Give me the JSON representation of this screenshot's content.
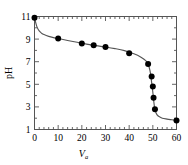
{
  "figure": {
    "background_color": "#ffffff",
    "line_color": "#555555",
    "marker_color": "#000000",
    "axis_color": "#555555"
  },
  "chart_data": {
    "type": "line",
    "title": "",
    "subtitle": "",
    "xlabel": "V",
    "xlabel_subscript": "a",
    "ylabel": "pH",
    "xlim": [
      0,
      60
    ],
    "ylim": [
      1,
      11
    ],
    "grid": false,
    "legend": null,
    "x_major_ticks": [
      0,
      10,
      20,
      30,
      40,
      50,
      60
    ],
    "x_tick_labels": [
      "0",
      "10",
      "20",
      "30",
      "40",
      "50",
      "60"
    ],
    "x_minor_interval": 2,
    "y_major_ticks": [
      1,
      3,
      5,
      7,
      9,
      11
    ],
    "y_tick_labels": [
      "1",
      "3",
      "5",
      "7",
      "9",
      "11"
    ],
    "y_minor_interval": 1,
    "ticks_direction": "in",
    "ticks_all_sides": true,
    "series": [
      {
        "name": "titration curve",
        "marker": "filled-circle",
        "x": [
          0,
          10,
          20,
          25,
          30,
          40,
          48,
          49.5,
          50,
          50.3,
          50.9,
          60
        ],
        "y": [
          10.9,
          9.05,
          8.6,
          8.45,
          8.3,
          7.75,
          6.8,
          5.7,
          4.8,
          3.8,
          2.8,
          1.8
        ]
      },
      {
        "name": "fitted curve",
        "marker": "none",
        "x": [
          0,
          1,
          2,
          3,
          4,
          6,
          8,
          10,
          14,
          18,
          22,
          26,
          30,
          34,
          38,
          42,
          45,
          47,
          48,
          48.8,
          49.3,
          49.7,
          50,
          50.2,
          50.5,
          50.8,
          51.2,
          51.8,
          52.6,
          54,
          56,
          58,
          60
        ],
        "y": [
          10.9,
          10.1,
          9.72,
          9.52,
          9.4,
          9.24,
          9.13,
          9.05,
          8.88,
          8.72,
          8.56,
          8.42,
          8.3,
          8.16,
          7.98,
          7.7,
          7.4,
          7.1,
          6.8,
          6.2,
          5.5,
          4.8,
          4.3,
          3.9,
          3.3,
          2.85,
          2.55,
          2.3,
          2.15,
          2.0,
          1.92,
          1.86,
          1.8
        ]
      }
    ]
  }
}
